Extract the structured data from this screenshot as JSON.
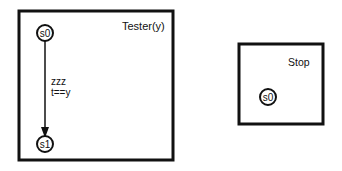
{
  "diagram": {
    "type": "state-machine",
    "processes": [
      {
        "name": "Tester(y)",
        "states": [
          {
            "id": "s0",
            "label": "s0"
          },
          {
            "id": "s1",
            "label": "s1"
          }
        ],
        "transitions": [
          {
            "from": "s0",
            "to": "s1",
            "label_line1": "zzz",
            "label_line2": "t==y"
          }
        ]
      },
      {
        "name": "Stop",
        "states": [
          {
            "id": "s0",
            "label": "s0"
          }
        ],
        "transitions": []
      }
    ]
  },
  "colors": {
    "stroke": "#111111",
    "background": "#ffffff"
  }
}
